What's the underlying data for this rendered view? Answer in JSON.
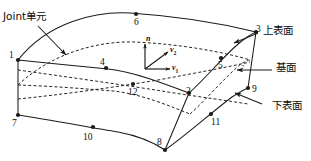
{
  "figure": {
    "background_color": "#ffffff",
    "line_color": "#1a1a1a",
    "width": 311,
    "height": 161
  },
  "annotations": {
    "joint_element": "Joint单元",
    "upper_surface": "上表面",
    "base_surface": "基面",
    "lower_surface": "下表面"
  },
  "vectors": [
    {
      "id": "n",
      "label": "n",
      "subscript": "",
      "direction": "up",
      "description": "normal vector"
    },
    {
      "id": "v2",
      "label": "v",
      "subscript": "2",
      "direction": "up-right",
      "description": "tangent vector 2"
    },
    {
      "id": "v1",
      "label": "v",
      "subscript": "1",
      "direction": "right",
      "description": "tangent vector 1"
    }
  ],
  "nodes": [
    {
      "id": 1,
      "label": "1",
      "surface": "upper"
    },
    {
      "id": 2,
      "label": "2",
      "surface": "upper"
    },
    {
      "id": 3,
      "label": "3",
      "surface": "upper"
    },
    {
      "id": 4,
      "label": "4",
      "surface": "upper"
    },
    {
      "id": 5,
      "label": "5",
      "surface": "upper"
    },
    {
      "id": 6,
      "label": "6",
      "surface": "upper"
    },
    {
      "id": 7,
      "label": "7",
      "surface": "lower"
    },
    {
      "id": 8,
      "label": "8",
      "surface": "lower"
    },
    {
      "id": 9,
      "label": "9",
      "surface": "lower"
    },
    {
      "id": 10,
      "label": "10",
      "surface": "lower"
    },
    {
      "id": 11,
      "label": "11",
      "surface": "lower"
    },
    {
      "id": 12,
      "label": "12",
      "surface": "lower"
    }
  ],
  "base_plane_marker": "7"
}
